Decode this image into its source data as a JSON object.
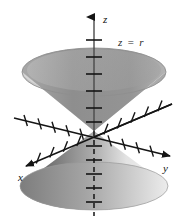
{
  "figure": {
    "name": "double-cone-z-equals-r",
    "top_caption": "",
    "equation_label": "z = r",
    "axes": [
      {
        "id": "x",
        "label": "x",
        "direction": "down-left",
        "ticks": 11
      },
      {
        "id": "y",
        "label": "y",
        "direction": "down-right",
        "ticks": 11
      },
      {
        "id": "z",
        "label": "z",
        "direction": "up",
        "ticks_upper": 6,
        "ticks_lower": 6,
        "lower_style": "dashed"
      }
    ],
    "surfaces": [
      {
        "id": "upper-cone",
        "opens": "up",
        "style": "open-rim",
        "outer_color": "#d4d4d4",
        "inner_color": "#8d8d8d"
      },
      {
        "id": "lower-cone",
        "opens": "down",
        "style": "solid",
        "dark_color": "#6f6f6f",
        "light_color": "#f2f2f2"
      }
    ],
    "colors": {
      "axis": "#151515",
      "surface_light": "#e2e2e2",
      "surface_mid": "#b0b0b0",
      "surface_dark": "#707070",
      "background": "#ffffff"
    }
  }
}
